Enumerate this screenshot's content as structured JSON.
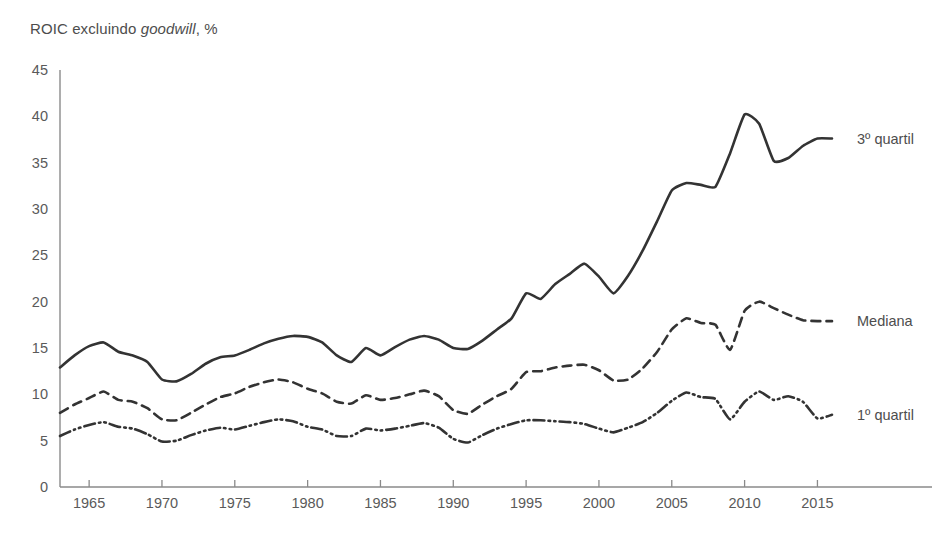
{
  "title": {
    "prefix": "ROIC excluindo ",
    "italic": "goodwill",
    "suffix": ", %"
  },
  "chart_data": {
    "type": "line",
    "title": "ROIC excluindo goodwill, %",
    "xlabel": "",
    "ylabel": "ROIC excluindo goodwill, %",
    "xlim": [
      1963,
      2016
    ],
    "ylim": [
      0,
      45
    ],
    "yticks": [
      0,
      5,
      10,
      15,
      20,
      25,
      30,
      35,
      40,
      45
    ],
    "xticks": [
      1965,
      1970,
      1975,
      1980,
      1985,
      1990,
      1995,
      2000,
      2005,
      2010,
      2015
    ],
    "grid": false,
    "legend_position": "right-inline",
    "x": [
      1963,
      1964,
      1965,
      1966,
      1967,
      1968,
      1969,
      1970,
      1971,
      1972,
      1973,
      1974,
      1975,
      1976,
      1977,
      1978,
      1979,
      1980,
      1981,
      1982,
      1983,
      1984,
      1985,
      1986,
      1987,
      1988,
      1989,
      1990,
      1991,
      1992,
      1993,
      1994,
      1995,
      1996,
      1997,
      1998,
      1999,
      2000,
      2001,
      2002,
      2003,
      2004,
      2005,
      2006,
      2007,
      2008,
      2009,
      2010,
      2011,
      2012,
      2013,
      2014,
      2015,
      2016
    ],
    "series": [
      {
        "name": "3º quartil",
        "style": "solid",
        "label": "3º quartil",
        "values": [
          12.9,
          14.2,
          15.2,
          15.6,
          14.6,
          14.2,
          13.5,
          11.6,
          11.4,
          12.2,
          13.3,
          14.0,
          14.2,
          14.8,
          15.5,
          16.0,
          16.3,
          16.2,
          15.6,
          14.2,
          13.5,
          15.0,
          14.2,
          15.1,
          15.9,
          16.3,
          15.9,
          15.0,
          14.9,
          15.8,
          17.0,
          18.2,
          20.9,
          20.3,
          21.9,
          23.0,
          24.1,
          22.7,
          20.9,
          22.8,
          25.5,
          28.7,
          32.0,
          32.8,
          32.6,
          32.4,
          36.0,
          40.2,
          39.2,
          35.2,
          35.5,
          36.8,
          37.6,
          37.6
        ]
      },
      {
        "name": "Mediana",
        "style": "dashed",
        "label": "Mediana",
        "values": [
          8.0,
          8.9,
          9.6,
          10.3,
          9.4,
          9.2,
          8.5,
          7.3,
          7.2,
          8.0,
          8.9,
          9.7,
          10.1,
          10.8,
          11.3,
          11.6,
          11.3,
          10.6,
          10.1,
          9.2,
          9.0,
          9.9,
          9.4,
          9.6,
          10.0,
          10.4,
          9.8,
          8.3,
          7.9,
          8.9,
          9.8,
          10.6,
          12.4,
          12.5,
          12.9,
          13.1,
          13.2,
          12.6,
          11.5,
          11.6,
          12.8,
          14.6,
          17.0,
          18.2,
          17.7,
          17.5,
          14.8,
          19.0,
          20.0,
          19.3,
          18.6,
          18.0,
          17.9,
          17.9
        ]
      },
      {
        "name": "1º quartil",
        "style": "dashdotdot",
        "label": "1º quartil",
        "values": [
          5.5,
          6.2,
          6.7,
          7.0,
          6.5,
          6.3,
          5.7,
          4.9,
          5.0,
          5.6,
          6.1,
          6.4,
          6.2,
          6.6,
          7.0,
          7.3,
          7.1,
          6.5,
          6.2,
          5.5,
          5.5,
          6.3,
          6.1,
          6.3,
          6.6,
          6.9,
          6.4,
          5.2,
          4.8,
          5.6,
          6.3,
          6.8,
          7.2,
          7.2,
          7.1,
          7.0,
          6.8,
          6.3,
          5.9,
          6.4,
          7.0,
          8.0,
          9.3,
          10.2,
          9.7,
          9.5,
          7.3,
          9.2,
          10.3,
          9.4,
          9.8,
          9.2,
          7.4,
          7.8
        ]
      }
    ]
  },
  "axes": {
    "y_tick_labels": [
      "45",
      "40",
      "35",
      "30",
      "25",
      "20",
      "15",
      "10",
      "5",
      "0"
    ],
    "x_tick_labels": [
      "1965",
      "1970",
      "1975",
      "1980",
      "1985",
      "1990",
      "1995",
      "2000",
      "2005",
      "2010",
      "2015"
    ]
  },
  "colors": {
    "line": "#333333",
    "axis": "#8a8a8a",
    "text": "#4d4d4d",
    "background": "#ffffff"
  }
}
